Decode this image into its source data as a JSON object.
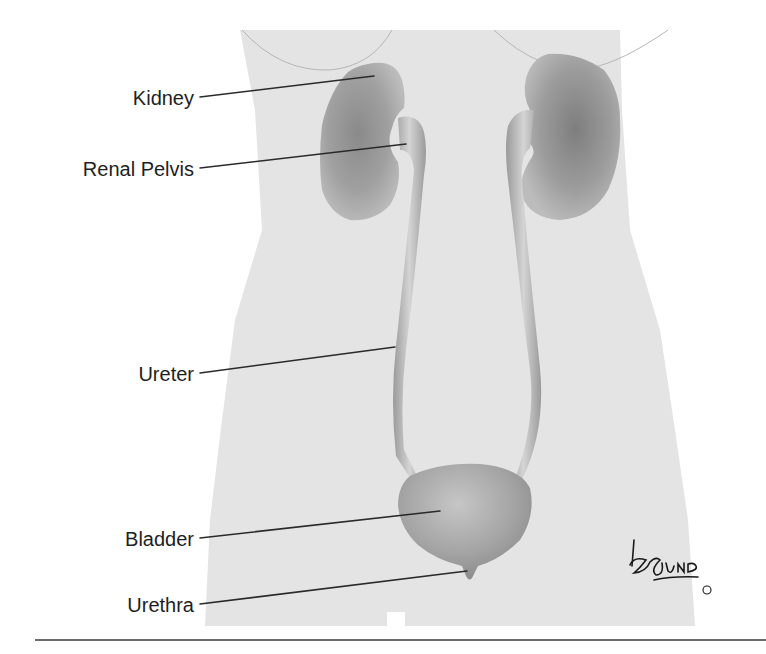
{
  "figure": {
    "labels": [
      {
        "id": "kidney",
        "text": "Kidney",
        "text_y": 86,
        "line": [
          200,
          97,
          374,
          76
        ]
      },
      {
        "id": "renal-pelvis",
        "text": "Renal Pelvis",
        "text_y": 157,
        "line": [
          200,
          168,
          406,
          144
        ]
      },
      {
        "id": "ureter",
        "text": "Ureter",
        "text_y": 362,
        "line": [
          200,
          373,
          395,
          347
        ]
      },
      {
        "id": "bladder",
        "text": "Bladder",
        "text_y": 527,
        "line": [
          200,
          538,
          440,
          511
        ]
      },
      {
        "id": "urethra",
        "text": "Urethra",
        "text_y": 593,
        "line": [
          200,
          604,
          467,
          571
        ]
      }
    ],
    "signature": "Lund",
    "copyright_mark": "©"
  },
  "colors": {
    "body_fill": "#e4e4e4",
    "organ_dark": "#7a7a7a",
    "organ_mid": "#a6a6a6",
    "organ_light": "#cfcfcf",
    "line": "#2a2a2a",
    "text": "#1e1e1e"
  }
}
